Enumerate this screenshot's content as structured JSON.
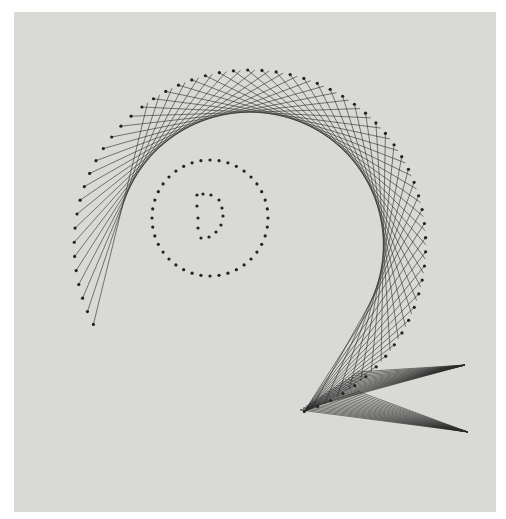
{
  "image": {
    "subject": "string art",
    "description": "Black thread string art on a light gray board forming a large curved Q-like shape, with a dotted circle containing a dotted letter D in the center",
    "colors": {
      "background": "#d9d9d6",
      "thread": "#2a2a2a",
      "frame": "#ffffff"
    }
  }
}
